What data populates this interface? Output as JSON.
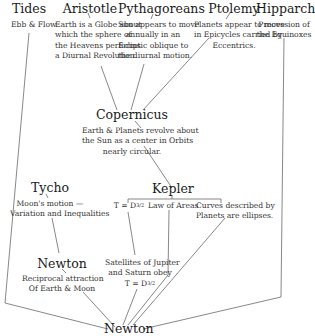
{
  "diagram": {
    "nodes": {
      "tides": {
        "title": "Tides",
        "desc": [
          "Ebb & Flow"
        ]
      },
      "aristotle": {
        "title": "Aristotle",
        "desc": [
          "Earth is a Globe about",
          "which the sphere of",
          "the Heavens performs",
          "a Diurnal Revolution."
        ]
      },
      "pythagoreans": {
        "title": "Pythagoreans",
        "desc": [
          "Sun appears to move",
          "annually in an",
          "Ecliptic oblique to",
          "the diurnal motion."
        ]
      },
      "ptolemy": {
        "title": "Ptolemy",
        "desc": [
          "Planets appear to move",
          "in Epicycles carried by",
          "Eccentrics."
        ]
      },
      "hipparchus": {
        "title": "Hipparchus",
        "desc": [
          "Precession of",
          "the Equinoxes"
        ]
      },
      "copernicus": {
        "title": "Copernicus",
        "desc": [
          "Earth & Planets revolve about",
          "the Sun as a center in Orbits",
          "nearly circular."
        ]
      },
      "tycho": {
        "title": "Tycho",
        "desc": [
          "Moon's motion —",
          "Variation and Inequalities"
        ]
      },
      "kepler": {
        "title": "Kepler",
        "laws": {
          "harmonic_base": "T = D",
          "harmonic_exp": "3/2",
          "areas": "Law of Areas",
          "ellipses": [
            "Curves described by",
            "Planets are ellipses."
          ]
        }
      },
      "newton_moon": {
        "title": "Newton",
        "desc": [
          "Reciprocal attraction",
          "Of Earth & Moon"
        ]
      },
      "satellites": {
        "desc": [
          "Satellites of Jupiter",
          "and Saturn obey"
        ],
        "formula_base": "T = D",
        "formula_exp": "3/2"
      },
      "newton_final": {
        "title": "Newton"
      }
    },
    "edges": [
      [
        "tides",
        "newton_final"
      ],
      [
        "aristotle",
        "copernicus"
      ],
      [
        "pythagoreans",
        "copernicus"
      ],
      [
        "ptolemy",
        "copernicus"
      ],
      [
        "copernicus",
        "kepler"
      ],
      [
        "tycho",
        "newton_moon"
      ],
      [
        "newton_moon",
        "newton_final"
      ],
      [
        "kepler_harmonic",
        "satellites"
      ],
      [
        "satellites",
        "newton_final"
      ],
      [
        "kepler_areas",
        "newton_final"
      ],
      [
        "kepler_ellipses",
        "newton_final"
      ],
      [
        "hipparchus",
        "newton_final"
      ]
    ]
  }
}
